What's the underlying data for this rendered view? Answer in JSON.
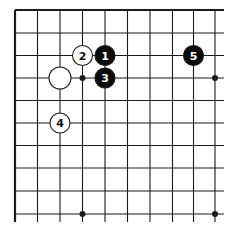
{
  "diagram": {
    "type": "go-board-fragment",
    "grid": {
      "columns": 10,
      "rows": 10,
      "x": [
        15,
        37.5,
        60,
        82.5,
        105,
        127.5,
        150,
        172.5,
        193.5,
        215
      ],
      "y": [
        10,
        33,
        55.5,
        78,
        100.5,
        123,
        145.5,
        168,
        191,
        214
      ],
      "edges": {
        "top": "board-edge",
        "left": "board-edge",
        "right": "open",
        "bottom": "open"
      },
      "line_color": "#1a1a1a"
    },
    "star_points": [
      {
        "col": 3,
        "row": 3
      },
      {
        "col": 9,
        "row": 3
      },
      {
        "col": 3,
        "row": 9
      },
      {
        "col": 9,
        "row": 9
      }
    ],
    "stones": [
      {
        "color": "black",
        "col": 4,
        "row": 2,
        "label": "1"
      },
      {
        "color": "white",
        "col": 3,
        "row": 2,
        "label": "2"
      },
      {
        "color": "black",
        "col": 4,
        "row": 3,
        "label": "3"
      },
      {
        "color": "white",
        "col": 2,
        "row": 5,
        "label": "4"
      },
      {
        "color": "black",
        "col": 8,
        "row": 2,
        "label": "5"
      },
      {
        "color": "white",
        "col": 2,
        "row": 3,
        "label": ""
      }
    ],
    "colors": {
      "black_stone": "#0a0a0a",
      "white_stone": "#ffffff",
      "stone_outline": "#1a1a1a"
    }
  }
}
